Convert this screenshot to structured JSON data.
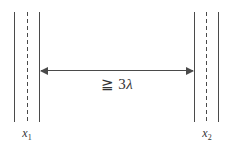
{
  "diagram": {
    "type": "schematic",
    "colors": {
      "background": "#ffffff",
      "line": "#4a4a4a",
      "text": "#333333"
    },
    "distance_label": {
      "symbol": "≧",
      "coefficient": "3",
      "variable": "λ",
      "full_text": "≧ 3λ"
    },
    "left_boundary": {
      "label_base": "x",
      "label_sub": "1"
    },
    "right_boundary": {
      "label_base": "x",
      "label_sub": "2"
    }
  }
}
